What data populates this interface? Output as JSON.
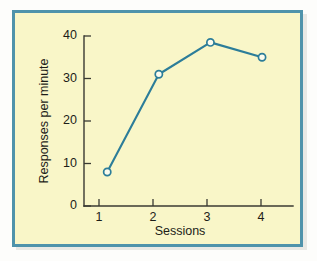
{
  "figure": {
    "frame_color": "#4f93ab",
    "plot_background": "#f9f6c8",
    "page_background": "#fdfdfb"
  },
  "chart_data": {
    "type": "line",
    "title": "",
    "subtitle": "",
    "xlabel": "Sessions",
    "ylabel": "Responses per minute",
    "x": [
      1,
      2,
      3,
      4
    ],
    "categories": [
      "1",
      "2",
      "3",
      "4"
    ],
    "values": [
      8,
      31,
      38.5,
      35
    ],
    "series": [
      {
        "name": "Responses per minute",
        "values": [
          8,
          31,
          38.5,
          35
        ],
        "line_color": "#2c7d99",
        "marker": "open-circle",
        "marker_fill": "#fbfbee"
      }
    ],
    "xlim": [
      0.55,
      4.6
    ],
    "ylim": [
      0,
      41
    ],
    "xticks": [
      1,
      2,
      3,
      4
    ],
    "xtick_labels": [
      "1",
      "2",
      "3",
      "4"
    ],
    "yticks": [
      0,
      10,
      20,
      30,
      40
    ],
    "ytick_labels": [
      "0",
      "10",
      "20",
      "30",
      "40"
    ],
    "tick_direction": "in",
    "grid": false,
    "legend": false,
    "legend_position": "none",
    "annotations": []
  },
  "labels": {
    "y_axis_title": "Responses per minute",
    "x_axis_title": "Sessions",
    "y_tick_0": "0",
    "y_tick_10": "10",
    "y_tick_20": "20",
    "y_tick_30": "30",
    "y_tick_40": "40",
    "x_tick_1": "1",
    "x_tick_2": "2",
    "x_tick_3": "3",
    "x_tick_4": "4"
  }
}
